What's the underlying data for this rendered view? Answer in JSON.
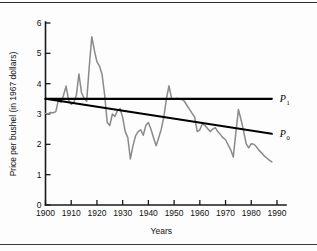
{
  "chart_data": {
    "type": "line",
    "title": "",
    "xlabel": "Years",
    "ylabel": "Price per bushel (in 1967 dollars)",
    "xlim": [
      1900,
      1990
    ],
    "ylim": [
      0,
      6
    ],
    "grid": false,
    "legend_position": "right-inline",
    "x_ticks": [
      1900,
      1910,
      1920,
      1930,
      1940,
      1950,
      1960,
      1970,
      1980,
      1990
    ],
    "y_ticks": [
      0,
      1,
      2,
      3,
      4,
      5,
      6
    ],
    "series": [
      {
        "name": "Price per bushel",
        "color": "#8a8a8a",
        "label": "",
        "x": [
          1900,
          1901,
          1902,
          1903,
          1904,
          1905,
          1906,
          1907,
          1908,
          1909,
          1910,
          1911,
          1912,
          1913,
          1914,
          1915,
          1916,
          1917,
          1918,
          1919,
          1920,
          1921,
          1922,
          1923,
          1924,
          1925,
          1926,
          1927,
          1928,
          1929,
          1930,
          1931,
          1932,
          1933,
          1934,
          1935,
          1936,
          1937,
          1938,
          1939,
          1940,
          1941,
          1942,
          1943,
          1944,
          1945,
          1946,
          1947,
          1948,
          1949,
          1950,
          1951,
          1952,
          1953,
          1954,
          1955,
          1956,
          1957,
          1958,
          1959,
          1960,
          1961,
          1962,
          1963,
          1964,
          1965,
          1966,
          1967,
          1968,
          1969,
          1970,
          1971,
          1972,
          1973,
          1974,
          1975,
          1976,
          1977,
          1978,
          1979,
          1980,
          1981,
          1982,
          1983,
          1984,
          1985,
          1986,
          1987,
          1988
        ],
        "values": [
          3.02,
          3.0,
          3.05,
          3.04,
          3.08,
          3.45,
          3.38,
          3.62,
          3.92,
          3.45,
          3.32,
          3.38,
          3.62,
          4.32,
          3.7,
          3.52,
          3.42,
          4.55,
          5.55,
          5.1,
          4.72,
          4.58,
          4.3,
          3.62,
          2.72,
          2.62,
          3.0,
          2.92,
          3.12,
          3.18,
          2.88,
          2.42,
          2.22,
          1.52,
          1.95,
          2.28,
          2.42,
          2.48,
          2.3,
          2.62,
          2.72,
          2.5,
          2.22,
          1.95,
          2.22,
          2.5,
          2.9,
          3.5,
          3.93,
          3.52,
          3.48,
          3.52,
          3.5,
          3.48,
          3.42,
          3.28,
          3.15,
          3.02,
          2.9,
          2.42,
          2.48,
          2.68,
          2.62,
          2.52,
          2.42,
          2.5,
          2.55,
          2.42,
          2.32,
          2.22,
          2.15,
          1.98,
          1.82,
          1.58,
          2.38,
          3.15,
          2.82,
          2.45,
          2.02,
          1.88,
          2.02,
          2.0,
          1.92,
          1.8,
          1.72,
          1.62,
          1.55,
          1.48,
          1.42
        ]
      },
      {
        "name": "P1 trend",
        "color": "#000000",
        "label": "P",
        "label_subscript": "1",
        "x": [
          1900,
          1988
        ],
        "values": [
          3.5,
          3.5
        ]
      },
      {
        "name": "P0 trend",
        "color": "#000000",
        "label": "P",
        "label_subscript": "0",
        "x": [
          1900,
          1988
        ],
        "values": [
          3.5,
          2.35
        ]
      }
    ]
  }
}
